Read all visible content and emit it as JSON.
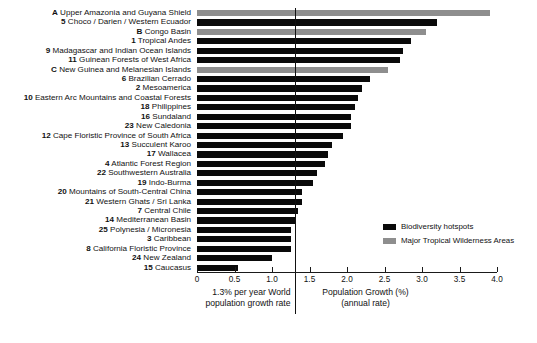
{
  "chart_data": {
    "type": "bar",
    "orientation": "horizontal",
    "title": "",
    "xlabel": "Population Growth (%)",
    "xlabel_line2": "(annual rate)",
    "ylabel": "",
    "xlim": [
      0,
      4.0
    ],
    "xticks": [
      "0",
      "0.5",
      "1.0",
      "1.5",
      "2.0",
      "2.5",
      "3.0",
      "3.5",
      "4.0"
    ],
    "xtick_values": [
      0,
      0.5,
      1.0,
      1.5,
      2.0,
      2.5,
      3.0,
      3.5,
      4.0
    ],
    "grid": false,
    "legend_position": "lower-right",
    "reference_line": {
      "value": 1.3,
      "caption_line1": "1.3% per year World",
      "caption_line2": "population growth rate"
    },
    "series": [
      {
        "name": "Biodiversity hotspots",
        "color": "#0a0a0a",
        "key": "hotspot"
      },
      {
        "name": "Major Tropical Wilderness Areas",
        "color": "#8e8e8e",
        "key": "wilderness"
      }
    ],
    "categories": [
      {
        "rank": "A",
        "label": "Upper Amazonia and Guyana Shield",
        "value": 3.9,
        "series": "wilderness"
      },
      {
        "rank": "5",
        "label": "Choco / Darien / Western Ecuador",
        "value": 3.2,
        "series": "hotspot"
      },
      {
        "rank": "B",
        "label": "Congo Basin",
        "value": 3.05,
        "series": "wilderness"
      },
      {
        "rank": "1",
        "label": "Tropical Andes",
        "value": 2.85,
        "series": "hotspot"
      },
      {
        "rank": "9",
        "label": "Madagascar and Indian Ocean Islands",
        "value": 2.75,
        "series": "hotspot"
      },
      {
        "rank": "11",
        "label": "Guinean Forests of West Africa",
        "value": 2.7,
        "series": "hotspot"
      },
      {
        "rank": "C",
        "label": "New Guinea and Melanesian Islands",
        "value": 2.55,
        "series": "wilderness"
      },
      {
        "rank": "6",
        "label": "Brazilian Cerrado",
        "value": 2.3,
        "series": "hotspot"
      },
      {
        "rank": "2",
        "label": "Mesoamerica",
        "value": 2.2,
        "series": "hotspot"
      },
      {
        "rank": "10",
        "label": "Eastern Arc Mountains and Coastal Forests",
        "value": 2.15,
        "series": "hotspot"
      },
      {
        "rank": "18",
        "label": "Philippines",
        "value": 2.1,
        "series": "hotspot"
      },
      {
        "rank": "16",
        "label": "Sundaland",
        "value": 2.05,
        "series": "hotspot"
      },
      {
        "rank": "23",
        "label": "New Caledonia",
        "value": 2.05,
        "series": "hotspot"
      },
      {
        "rank": "12",
        "label": "Cape Floristic Province of South Africa",
        "value": 1.95,
        "series": "hotspot"
      },
      {
        "rank": "13",
        "label": "Succulent Karoo",
        "value": 1.8,
        "series": "hotspot"
      },
      {
        "rank": "17",
        "label": "Wallacea",
        "value": 1.75,
        "series": "hotspot"
      },
      {
        "rank": "4",
        "label": "Atlantic Forest Region",
        "value": 1.7,
        "series": "hotspot"
      },
      {
        "rank": "22",
        "label": "Southwestern Australia",
        "value": 1.6,
        "series": "hotspot"
      },
      {
        "rank": "19",
        "label": "Indo-Burma",
        "value": 1.55,
        "series": "hotspot"
      },
      {
        "rank": "20",
        "label": "Mountains of South-Central China",
        "value": 1.4,
        "series": "hotspot"
      },
      {
        "rank": "21",
        "label": "Western Ghats / Sri Lanka",
        "value": 1.4,
        "series": "hotspot"
      },
      {
        "rank": "7",
        "label": "Central Chile",
        "value": 1.35,
        "series": "hotspot"
      },
      {
        "rank": "14",
        "label": "Mediterranean Basin",
        "value": 1.3,
        "series": "hotspot"
      },
      {
        "rank": "25",
        "label": "Polynesia / Micronesia",
        "value": 1.25,
        "series": "hotspot"
      },
      {
        "rank": "3",
        "label": "Caribbean",
        "value": 1.25,
        "series": "hotspot"
      },
      {
        "rank": "8",
        "label": "California Floristic Province",
        "value": 1.25,
        "series": "hotspot"
      },
      {
        "rank": "24",
        "label": "New Zealand",
        "value": 1.0,
        "series": "hotspot"
      },
      {
        "rank": "15",
        "label": "Caucasus",
        "value": 0.55,
        "series": "hotspot"
      }
    ]
  }
}
